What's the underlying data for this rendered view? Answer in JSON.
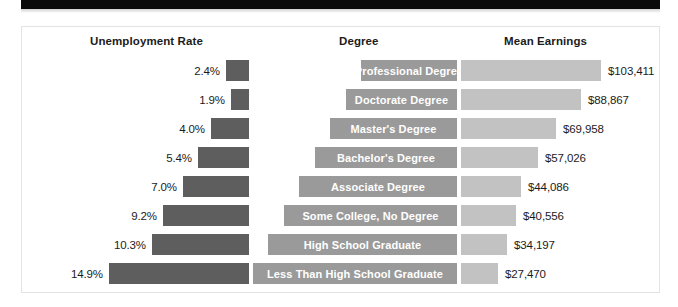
{
  "banner": {
    "name": "top-black-bar"
  },
  "headers": {
    "unemployment": "Unemployment Rate",
    "degree": "Degree",
    "earnings": "Mean Earnings"
  },
  "colors": {
    "unemployment_bar": "#5e5e5e",
    "degree_bar": "#9a9a9a",
    "earnings_bar": "#c2c2c2",
    "card_border": "#e3e3e5",
    "banner": "#0a0a0a",
    "text": "#1b1b1b",
    "bar_label_text": "#ffffff"
  },
  "chart_data": {
    "type": "bar",
    "title": "",
    "xlabel": "",
    "ylabel": "",
    "grid": false,
    "legend_position": "none",
    "orientation": "horizontal",
    "categories": [
      "Professional Degree",
      "Doctorate Degree",
      "Master's Degree",
      "Bachelor's Degree",
      "Associate Degree",
      "Some College, No Degree",
      "High School Graduate",
      "Less Than High School Graduate"
    ],
    "series": [
      {
        "name": "Unemployment Rate",
        "unit": "%",
        "values": [
          2.4,
          1.9,
          4.0,
          5.4,
          7.0,
          9.2,
          10.3,
          14.9
        ],
        "labels": [
          "2.4%",
          "1.9%",
          "4.0%",
          "5.4%",
          "7.0%",
          "9.2%",
          "10.3%",
          "14.9%"
        ],
        "xlim": [
          0,
          14.9
        ]
      },
      {
        "name": "Mean Earnings",
        "unit": "$",
        "values": [
          103411,
          88867,
          69958,
          57026,
          44086,
          40556,
          34197,
          27470
        ],
        "labels": [
          "$103,411",
          "$88,867",
          "$69,958",
          "$57,026",
          "$44,086",
          "$40,556",
          "$34,197",
          "$27,470"
        ],
        "xlim": [
          0,
          103411
        ]
      }
    ]
  },
  "rows": [
    {
      "pct": "2.4%",
      "pct_value": 2.4,
      "degree": "Professional Degree",
      "earnings": "$103,411",
      "earnings_value": 103411
    },
    {
      "pct": "1.9%",
      "pct_value": 1.9,
      "degree": "Doctorate Degree",
      "earnings": "$88,867",
      "earnings_value": 88867
    },
    {
      "pct": "4.0%",
      "pct_value": 4.0,
      "degree": "Master's Degree",
      "earnings": "$69,958",
      "earnings_value": 69958
    },
    {
      "pct": "5.4%",
      "pct_value": 5.4,
      "degree": "Bachelor's Degree",
      "earnings": "$57,026",
      "earnings_value": 57026
    },
    {
      "pct": "7.0%",
      "pct_value": 7.0,
      "degree": "Associate Degree",
      "earnings": "$44,086",
      "earnings_value": 44086
    },
    {
      "pct": "9.2%",
      "pct_value": 9.2,
      "degree": "Some College, No Degree",
      "earnings": "$40,556",
      "earnings_value": 40556
    },
    {
      "pct": "10.3%",
      "pct_value": 10.3,
      "degree": "High School Graduate",
      "earnings": "$34,197",
      "earnings_value": 34197
    },
    {
      "pct": "14.9%",
      "pct_value": 14.9,
      "degree": "Less Than High School Graduate",
      "earnings": "$27,470",
      "earnings_value": 27470
    }
  ]
}
